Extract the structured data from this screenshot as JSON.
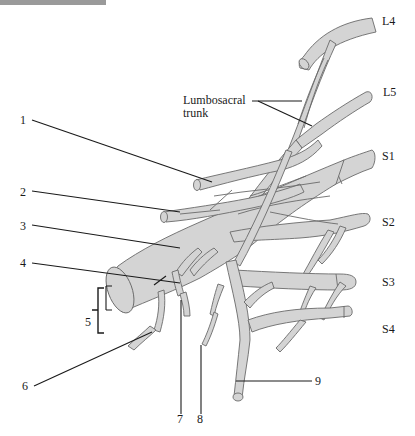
{
  "diagram": {
    "type": "anatomical-illustration",
    "colors": {
      "nerve_fill": "#d4d4d4",
      "nerve_outline": "#6a6a6a",
      "leader_line": "#1a1a1a",
      "header_strip": "#9a9a9a"
    },
    "root_labels": {
      "l4": "L4",
      "l5": "L5",
      "s1": "S1",
      "s2": "S2",
      "s3": "S3",
      "s4": "S4"
    },
    "named_labels": {
      "lumbosacral_line1": "Lumbosacral",
      "lumbosacral_line2": "trunk"
    },
    "numbered_labels": [
      "1",
      "2",
      "3",
      "4",
      "5",
      "6",
      "7",
      "8",
      "9"
    ]
  }
}
